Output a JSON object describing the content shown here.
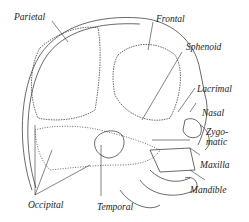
{
  "diagram": {
    "labels": {
      "parietal": "Parietal",
      "frontal": "Frontal",
      "sphenoid": "Sphenoid",
      "lacrimal": "Lacrimal",
      "nasal": "Nasal",
      "zygomatic_1": "Zygo-",
      "zygomatic_2": "matic",
      "maxilla": "Maxilla",
      "mandible": "Mandible",
      "occipital": "Occipital",
      "temporal": "Temporal"
    },
    "colors": {
      "ink": "#333333",
      "background": "#ffffff"
    }
  }
}
